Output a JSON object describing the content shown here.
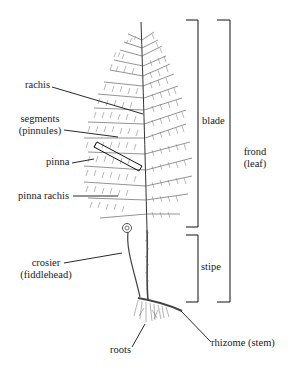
{
  "diagram": {
    "title": "",
    "colors": {
      "ink": "#1a1a1a",
      "background": "#ffffff",
      "foliage": "#555555"
    },
    "labels": {
      "rachis": "rachis",
      "segments_line1": "segments",
      "segments_line2": "(pinnules)",
      "pinna": "pinna",
      "pinna_rachis": "pinna rachis",
      "crosier_line1": "crosier",
      "crosier_line2": "(fiddlehead)",
      "roots": "roots",
      "rhizome": "rhizome (stem)",
      "blade": "blade",
      "stipe": "stipe",
      "frond_line1": "frond",
      "frond_line2": "(leaf)"
    },
    "brackets": [
      {
        "name": "blade",
        "x": 198,
        "top": 20,
        "bottom": 227
      },
      {
        "name": "stipe",
        "x": 198,
        "top": 235,
        "bottom": 302
      },
      {
        "name": "frond",
        "x": 230,
        "top": 20,
        "bottom": 302
      }
    ]
  }
}
